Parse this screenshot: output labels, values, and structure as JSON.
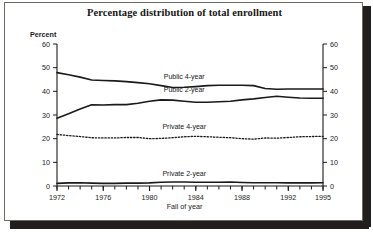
{
  "figure": {
    "title": "Percentage distribution of total enrollment",
    "y_axis_label": "Percent",
    "x_axis_label": "Fall of year",
    "caption": ""
  },
  "colors": {
    "line": "#1a1a1a",
    "frame": "#6d6a66",
    "shadow": "#201f1d",
    "background": "#ffffff",
    "text": "#1b1b1b"
  },
  "chart_data": {
    "type": "line",
    "title": "Percentage distribution of total enrollment",
    "xlabel": "Fall of year",
    "ylabel": "Percent",
    "xlim": [
      1972,
      1995
    ],
    "ylim": [
      0,
      60
    ],
    "ytick_labels": [
      "0",
      "10",
      "20",
      "30",
      "40",
      "50",
      "60"
    ],
    "yticks": [
      0,
      10,
      20,
      30,
      40,
      50,
      60
    ],
    "xtick_labels": [
      "1972",
      "1976",
      "1980",
      "1984",
      "1988",
      "1992",
      "1995"
    ],
    "xticks": [
      1972,
      1976,
      1980,
      1984,
      1988,
      1992,
      1995
    ],
    "minor_xticks_every": 1,
    "grid": false,
    "dual_y_axis": true,
    "legend": "inline-labels",
    "x": [
      1972,
      1973,
      1974,
      1975,
      1976,
      1977,
      1978,
      1979,
      1980,
      1981,
      1982,
      1983,
      1984,
      1985,
      1986,
      1987,
      1988,
      1989,
      1990,
      1991,
      1992,
      1993,
      1994,
      1995
    ],
    "series": [
      {
        "name": "Public 4-year",
        "label": "Public 4-year",
        "style": "solid",
        "label_x": 1983.0,
        "label_y": 45.4,
        "values": [
          47.9,
          47.0,
          46.0,
          44.8,
          44.6,
          44.4,
          44.1,
          43.7,
          43.2,
          42.4,
          41.6,
          41.7,
          42.0,
          42.4,
          42.6,
          42.6,
          42.6,
          42.4,
          41.2,
          40.9,
          41.0,
          41.0,
          41.0,
          41.0
        ],
        "endpoints": {
          "start": 47.9,
          "end": 41.0
        },
        "units": "percent"
      },
      {
        "name": "Public 2-year",
        "label": "Public 2-year",
        "style": "solid",
        "label_x": 1983.0,
        "label_y": 39.7,
        "values": [
          28.6,
          30.5,
          32.5,
          34.3,
          34.2,
          34.4,
          34.4,
          35.0,
          35.8,
          36.4,
          36.3,
          35.8,
          35.4,
          35.4,
          35.6,
          35.8,
          36.4,
          36.8,
          37.4,
          37.9,
          37.5,
          37.2,
          37.1,
          37.1
        ],
        "endpoints": {
          "start": 28.6,
          "end": 37.1
        },
        "units": "percent"
      },
      {
        "name": "Private 4-year",
        "label": "Private 4-year",
        "style": "dotted",
        "label_x": 1983.0,
        "label_y": 24.1,
        "values": [
          21.8,
          21.3,
          20.9,
          20.4,
          20.3,
          20.3,
          20.5,
          20.5,
          20.0,
          20.1,
          20.4,
          20.8,
          21.0,
          20.8,
          20.6,
          20.4,
          20.0,
          19.8,
          20.3,
          20.2,
          20.5,
          20.8,
          20.9,
          21.0
        ],
        "endpoints": {
          "start": 21.8,
          "end": 21.0
        },
        "units": "percent"
      },
      {
        "name": "Private 2-year",
        "label": "Private 2-year",
        "style": "solid",
        "label_x": 1983.0,
        "label_y": 4.3,
        "values": [
          1.1,
          1.3,
          1.4,
          1.2,
          1.1,
          1.1,
          1.2,
          1.2,
          1.3,
          1.6,
          1.7,
          1.7,
          1.6,
          1.6,
          1.6,
          1.7,
          1.5,
          1.4,
          1.4,
          1.4,
          1.3,
          1.3,
          1.3,
          1.4
        ],
        "endpoints": {
          "start": 1.1,
          "end": 1.4
        },
        "units": "percent"
      }
    ]
  }
}
